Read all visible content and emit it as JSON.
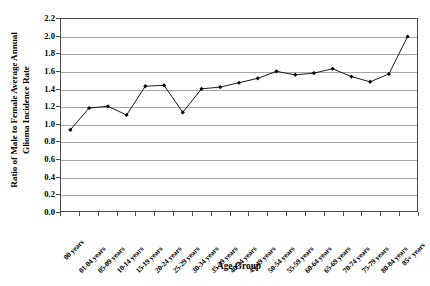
{
  "chart_data": {
    "type": "line",
    "title": "",
    "xlabel": "Age Group",
    "ylabel": "Ratio of Male to Female Average Annual Glioma Incidence Rate",
    "ylabel_lines": [
      "Ratio of Male to Female Average Annual",
      "Glioma Incidence Rate"
    ],
    "categories": [
      "00 years",
      "01-04 years",
      "05-09 years",
      "10-14 years",
      "15-19 years",
      "20-24 years",
      "25-29 years",
      "30-34 years",
      "35-39 years",
      "40-44 years",
      "45-49 years",
      "50-54 years",
      "55-59 years",
      "60-64 years",
      "65-69 years",
      "70-74 years",
      "75-79 years",
      "80-84 years",
      "85+ years"
    ],
    "values": [
      0.93,
      1.18,
      1.2,
      1.1,
      1.43,
      1.44,
      1.13,
      1.4,
      1.42,
      1.47,
      1.52,
      1.6,
      1.56,
      1.58,
      1.63,
      1.54,
      1.48,
      1.57,
      2.0
    ],
    "ylim": [
      0.0,
      2.2
    ],
    "ytick_labels": [
      "0.0",
      "0.2",
      "0.4",
      "0.6",
      "0.8",
      "1.0",
      "1.2",
      "1.4",
      "1.6",
      "1.8",
      "2.0",
      "2.2"
    ],
    "ytick_values": [
      0.0,
      0.2,
      0.4,
      0.6,
      0.8,
      1.0,
      1.2,
      1.4,
      1.6,
      1.8,
      2.0,
      2.2
    ],
    "grid": true,
    "legend": false,
    "legend_position": "none",
    "series_color": "#000000",
    "grid_color": "#a6a6a6",
    "axis_color": "#4d4d4d",
    "marker": "diamond"
  }
}
